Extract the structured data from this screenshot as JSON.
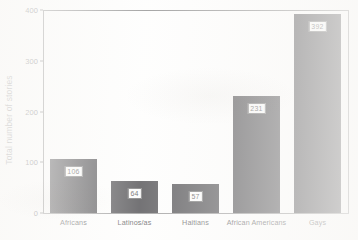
{
  "chart_data": {
    "type": "bar",
    "title": "",
    "xlabel": "",
    "ylabel": "Total number of stories",
    "categories": [
      "Africans",
      "Latinos/as",
      "Haitians",
      "African Americans",
      "Gays"
    ],
    "values": [
      106,
      64,
      57,
      231,
      392
    ],
    "value_labels": [
      "106",
      "64",
      "57",
      "231",
      "392"
    ],
    "ylim": [
      0,
      400
    ],
    "yticks": [
      0,
      100,
      200,
      300,
      400
    ],
    "ytick_labels": [
      "0",
      "100",
      "200",
      "300",
      "400"
    ],
    "grid": false,
    "legend": null,
    "bar_color": "#17161a",
    "axis_color": "#6b6b6b",
    "background_color": "#fdfdfc"
  }
}
